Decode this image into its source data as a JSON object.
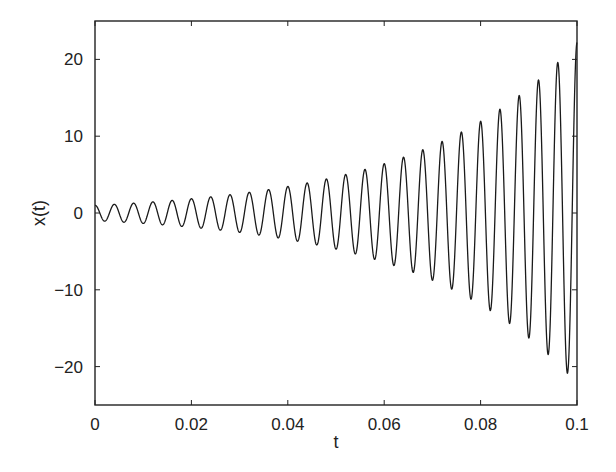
{
  "chart_data": {
    "type": "line",
    "title": "",
    "xlabel": "t",
    "ylabel": "x(t)",
    "xlim": [
      0,
      0.1
    ],
    "ylim": [
      -25,
      25
    ],
    "xticks": [
      0,
      0.02,
      0.04,
      0.06,
      0.08,
      0.1
    ],
    "xtick_labels": [
      "0",
      "0.02",
      "0.04",
      "0.06",
      "0.08",
      "0.1"
    ],
    "yticks": [
      -20,
      -10,
      0,
      10,
      20
    ],
    "ytick_labels": [
      "−20",
      "−10",
      "0",
      "10",
      "20"
    ],
    "grid": false,
    "legend": null,
    "line_color": "#1a1a1a",
    "series": [
      {
        "name": "x(t)",
        "description": "Exponentially growing sinusoid: x(t) = e^(a t) cos(2π f t)",
        "model": {
          "amplitude_at_t0": 1.0,
          "growth_rate_per_s": 31,
          "frequency_hz": 250,
          "phase": 0
        },
        "sample_peaks": {
          "t": [
            0.0,
            0.004,
            0.008,
            0.04,
            0.052,
            0.064,
            0.076,
            0.084,
            0.088,
            0.092,
            0.096
          ],
          "x": [
            1.0,
            1.1,
            1.3,
            3.2,
            4.9,
            7.3,
            10.5,
            14.0,
            15.8,
            17.7,
            20.0
          ]
        },
        "end_value": 22.2
      }
    ]
  }
}
